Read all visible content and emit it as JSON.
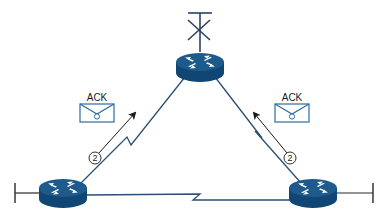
{
  "diagram": {
    "type": "network-topology",
    "colors": {
      "router_top": "#1e5b8c",
      "router_side": "#0f4674",
      "router_arrows": "#ffffff",
      "link": "#2b4f72",
      "envelope": "#2a6da3",
      "arrow": "#1a1a1a",
      "text": "#1a1a1a",
      "antenna": "#2a4360"
    },
    "nodes": [
      {
        "id": "router-top",
        "icon": "router-icon",
        "has_antenna": true,
        "antenna_icon": "antenna-x-icon"
      },
      {
        "id": "router-bottom-left",
        "icon": "router-icon",
        "terminator": "left"
      },
      {
        "id": "router-bottom-right",
        "icon": "router-icon",
        "terminator": "right"
      }
    ],
    "links": [
      {
        "from": "router-bottom-left",
        "to": "router-top",
        "style": "serial-zigzag"
      },
      {
        "from": "router-top",
        "to": "router-bottom-right",
        "style": "serial-zigzag"
      },
      {
        "from": "router-bottom-left",
        "to": "router-bottom-right",
        "style": "serial-zigzag"
      }
    ],
    "messages": [
      {
        "side": "left",
        "label": "ACK",
        "icon": "envelope-icon",
        "step": "2",
        "direction": "toward router-top"
      },
      {
        "side": "right",
        "label": "ACK",
        "icon": "envelope-icon",
        "step": "2",
        "direction": "toward router-top"
      }
    ]
  }
}
